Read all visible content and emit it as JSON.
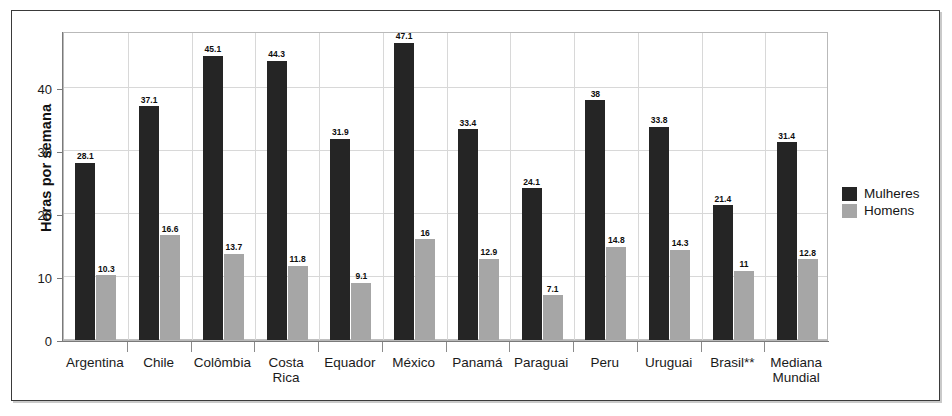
{
  "chart_data": {
    "type": "bar",
    "title": "",
    "xlabel": "",
    "ylabel": "Horas por semana",
    "ylim": [
      0,
      49
    ],
    "yticks": [
      0,
      10,
      20,
      30,
      40
    ],
    "grid": true,
    "legend_position": "right",
    "categories": [
      "Argentina",
      "Chile",
      "Colômbia",
      "Costa\nRica",
      "Equador",
      "México",
      "Panamá",
      "Paraguai",
      "Peru",
      "Uruguai",
      "Brasil**",
      "Mediana\nMundial"
    ],
    "series": [
      {
        "name": "Mulheres",
        "color": "#252525",
        "values": [
          28.1,
          37.1,
          45.1,
          44.3,
          31.9,
          47.1,
          33.4,
          24.1,
          38,
          33.8,
          21.4,
          31.4
        ],
        "labels": [
          "28.1",
          "37.1",
          "45.1",
          "44.3",
          "31.9",
          "47.1",
          "33.4",
          "24.1",
          "38",
          "33.8",
          "21.4",
          "31.4"
        ]
      },
      {
        "name": "Homens",
        "color": "#a6a6a6",
        "values": [
          10.3,
          16.6,
          13.7,
          11.8,
          9.1,
          16,
          12.9,
          7.1,
          14.8,
          14.3,
          11,
          12.8
        ],
        "labels": [
          "10.3",
          "16.6",
          "13.7",
          "11.8",
          "9.1",
          "16",
          "12.9",
          "7.1",
          "14.8",
          "14.3",
          "11",
          "12.8"
        ]
      }
    ]
  },
  "legend": {
    "items": [
      {
        "label": "Mulheres",
        "color": "#252525"
      },
      {
        "label": "Homens",
        "color": "#a6a6a6"
      }
    ]
  },
  "axis": {
    "y_title": "Horas por semana",
    "y_tick_labels": [
      "40",
      "30",
      "20",
      "10",
      "0"
    ]
  }
}
